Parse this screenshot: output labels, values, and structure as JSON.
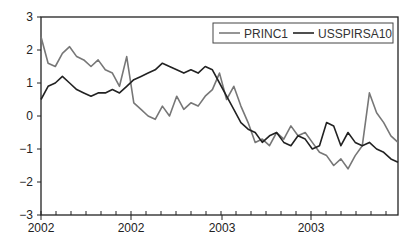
{
  "chart_data": {
    "type": "line",
    "title": "",
    "xlabel": "",
    "ylabel": "",
    "ylim": [
      -3,
      3
    ],
    "yticks": [
      3,
      2,
      1,
      0,
      -1,
      -2,
      -3
    ],
    "xtick_labels": [
      "2002",
      "2002",
      "2003",
      "2003"
    ],
    "grid": false,
    "legend_position": "top-right",
    "legend": [
      "PRINC1",
      "USSPIRSA10"
    ],
    "x": [
      0,
      2,
      4,
      6,
      8,
      10,
      12,
      14,
      16,
      18,
      20,
      22,
      24,
      26,
      28,
      30,
      32,
      34,
      36,
      38,
      40,
      42,
      44,
      46,
      48,
      50,
      52,
      54,
      56,
      58,
      60,
      62,
      64,
      66,
      68,
      70,
      72,
      74,
      76,
      78,
      80,
      82,
      84,
      86,
      88,
      90,
      92,
      94,
      96,
      98,
      100
    ],
    "series": [
      {
        "name": "PRINC1",
        "color": "#777777",
        "values": [
          2.4,
          1.6,
          1.5,
          1.9,
          2.1,
          1.8,
          1.7,
          1.5,
          1.7,
          1.4,
          1.3,
          0.9,
          1.8,
          0.4,
          0.2,
          0.0,
          -0.1,
          0.3,
          0.0,
          0.6,
          0.2,
          0.4,
          0.3,
          0.6,
          0.8,
          1.3,
          0.5,
          0.9,
          0.3,
          -0.2,
          -0.8,
          -0.7,
          -0.9,
          -0.5,
          -0.7,
          -0.3,
          -0.6,
          -0.5,
          -0.8,
          -1.1,
          -1.2,
          -1.5,
          -1.3,
          -1.6,
          -1.2,
          -0.9,
          0.7,
          0.1,
          -0.2,
          -0.6,
          -0.8
        ]
      },
      {
        "name": "USSPIRSA10",
        "color": "#222222",
        "values": [
          0.5,
          0.9,
          1.0,
          1.2,
          1.0,
          0.8,
          0.7,
          0.6,
          0.7,
          0.7,
          0.8,
          0.7,
          0.9,
          1.1,
          1.2,
          1.3,
          1.4,
          1.6,
          1.5,
          1.4,
          1.3,
          1.4,
          1.3,
          1.5,
          1.4,
          1.0,
          0.6,
          0.2,
          -0.2,
          -0.4,
          -0.5,
          -0.8,
          -0.6,
          -0.5,
          -0.8,
          -0.9,
          -0.6,
          -0.7,
          -1.0,
          -0.9,
          -0.2,
          -0.3,
          -0.9,
          -0.5,
          -0.8,
          -0.9,
          -0.8,
          -1.0,
          -1.1,
          -1.3,
          -1.4
        ]
      }
    ]
  },
  "axes": {
    "y_tick_labels": [
      "3",
      "2",
      "1",
      "0",
      "−1",
      "−2",
      "−3"
    ],
    "x_tick_labels": [
      "2002",
      "2002",
      "2003",
      "2003"
    ]
  },
  "legend": {
    "items": [
      {
        "label": "PRINC1",
        "color": "#777777"
      },
      {
        "label": "USSPIRSA10",
        "color": "#222222"
      }
    ]
  }
}
